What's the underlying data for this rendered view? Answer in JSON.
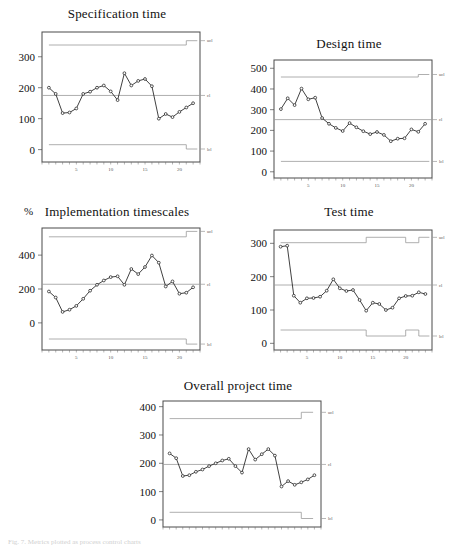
{
  "figure": {
    "caption_fragment": "Fig. 7. Metrics plotted as process control charts",
    "background": "#ffffff",
    "line_color": "#2b2b2b",
    "limit_color": "#9a9a9a",
    "frame_color": "#4a4a4a"
  },
  "limit_labels": {
    "ucl": "ucl",
    "cl": "cl",
    "lcl": "lcl"
  },
  "chart_data": [
    {
      "id": "specification-time",
      "type": "line",
      "title": "Specification time",
      "xlabel": "",
      "ylabel": "",
      "yunit": "",
      "xlim": [
        0,
        23
      ],
      "ylim": [
        -40,
        380
      ],
      "yticks": [
        0,
        100,
        200,
        300
      ],
      "xticks": [
        5,
        10,
        15,
        20
      ],
      "grid": false,
      "legend": "right-edge-labels",
      "x": [
        1,
        2,
        3,
        4,
        5,
        6,
        7,
        8,
        9,
        10,
        11,
        12,
        13,
        14,
        15,
        16,
        17,
        18,
        19,
        20,
        21,
        22
      ],
      "values": [
        200,
        180,
        118,
        120,
        133,
        180,
        187,
        200,
        207,
        188,
        160,
        247,
        207,
        222,
        228,
        205,
        100,
        115,
        105,
        122,
        136,
        150
      ],
      "control_limits": {
        "cl": 175,
        "ucl_segments": [
          {
            "from": 1,
            "to": 21,
            "value": 338
          },
          {
            "from": 21,
            "to": 22.6,
            "value": 352
          }
        ],
        "lcl_segments": [
          {
            "from": 1,
            "to": 21,
            "value": 16
          },
          {
            "from": 21,
            "to": 22.6,
            "value": 2
          }
        ]
      }
    },
    {
      "id": "design-time",
      "type": "line",
      "title": "Design time",
      "xlabel": "",
      "ylabel": "",
      "yunit": "",
      "xlim": [
        0,
        23
      ],
      "ylim": [
        -30,
        540
      ],
      "yticks": [
        0,
        100,
        200,
        300,
        400,
        500
      ],
      "xticks": [
        5,
        10,
        15,
        20
      ],
      "grid": false,
      "legend": "right-edge-labels",
      "x": [
        1,
        2,
        3,
        4,
        5,
        6,
        7,
        8,
        9,
        10,
        11,
        12,
        13,
        14,
        15,
        16,
        17,
        18,
        19,
        20,
        21,
        22
      ],
      "values": [
        303,
        355,
        322,
        402,
        350,
        358,
        260,
        232,
        212,
        197,
        235,
        215,
        196,
        182,
        192,
        178,
        148,
        160,
        162,
        205,
        193,
        232
      ],
      "control_limits": {
        "cl": 252,
        "ucl_segments": [
          {
            "from": 1,
            "to": 21,
            "value": 458
          },
          {
            "from": 21,
            "to": 22.6,
            "value": 470
          }
        ],
        "lcl_segments": [
          {
            "from": 1,
            "to": 22.6,
            "value": 50
          }
        ]
      }
    },
    {
      "id": "implementation-timescales",
      "type": "line",
      "title": "Implementation timescales",
      "xlabel": "",
      "ylabel": "",
      "yunit": "%",
      "xlim": [
        0,
        23
      ],
      "ylim": [
        -160,
        560
      ],
      "yticks": [
        0,
        200,
        400
      ],
      "xticks": [
        5,
        10,
        15,
        20
      ],
      "grid": false,
      "legend": "right-edge-labels",
      "x": [
        1,
        2,
        3,
        4,
        5,
        6,
        7,
        8,
        9,
        10,
        11,
        12,
        13,
        14,
        15,
        16,
        17,
        18,
        19,
        20,
        21,
        22
      ],
      "values": [
        185,
        150,
        65,
        78,
        100,
        142,
        190,
        225,
        250,
        270,
        275,
        225,
        318,
        288,
        330,
        398,
        355,
        215,
        245,
        172,
        178,
        210
      ],
      "control_limits": {
        "cl": 228,
        "ucl_segments": [
          {
            "from": 1,
            "to": 21,
            "value": 508
          },
          {
            "from": 21,
            "to": 22.6,
            "value": 540
          }
        ],
        "lcl_segments": [
          {
            "from": 1,
            "to": 21,
            "value": -95
          },
          {
            "from": 21,
            "to": 22.6,
            "value": -125
          }
        ]
      }
    },
    {
      "id": "test-time",
      "type": "line",
      "title": "Test time",
      "xlabel": "",
      "ylabel": "",
      "yunit": "",
      "xlim": [
        0,
        24
      ],
      "ylim": [
        -20,
        340
      ],
      "yticks": [
        0,
        100,
        200,
        300
      ],
      "xticks": [
        5,
        10,
        15,
        20
      ],
      "grid": false,
      "legend": "right-edge-labels",
      "x": [
        1,
        2,
        3,
        4,
        5,
        6,
        7,
        8,
        9,
        10,
        11,
        12,
        13,
        14,
        15,
        16,
        17,
        18,
        19,
        20,
        21,
        22,
        23
      ],
      "values": [
        290,
        293,
        143,
        122,
        135,
        136,
        140,
        158,
        192,
        165,
        157,
        160,
        130,
        98,
        122,
        118,
        100,
        107,
        135,
        142,
        143,
        153,
        148
      ],
      "control_limits": {
        "cl": 175,
        "ucl_segments": [
          {
            "from": 1,
            "to": 14,
            "value": 302
          },
          {
            "from": 14,
            "to": 20,
            "value": 318
          },
          {
            "from": 20,
            "to": 22,
            "value": 302
          },
          {
            "from": 22,
            "to": 23.6,
            "value": 318
          }
        ],
        "lcl_segments": [
          {
            "from": 1,
            "to": 14,
            "value": 40
          },
          {
            "from": 14,
            "to": 20,
            "value": 22
          },
          {
            "from": 20,
            "to": 22,
            "value": 40
          },
          {
            "from": 22,
            "to": 23.6,
            "value": 22
          }
        ]
      }
    },
    {
      "id": "overall-project-time",
      "type": "line",
      "title": "Overall project time",
      "xlabel": "",
      "ylabel": "",
      "yunit": "",
      "xlim": [
        0,
        24
      ],
      "ylim": [
        -25,
        420
      ],
      "yticks": [
        0,
        100,
        200,
        300,
        400
      ],
      "xticks": [],
      "grid": false,
      "legend": "right-edge-labels",
      "x": [
        1,
        2,
        3,
        4,
        5,
        6,
        7,
        8,
        9,
        10,
        11,
        12,
        13,
        14,
        15,
        16,
        17,
        18,
        19,
        20,
        21,
        22,
        23
      ],
      "values": [
        235,
        218,
        155,
        158,
        170,
        178,
        190,
        200,
        210,
        216,
        190,
        167,
        250,
        213,
        232,
        250,
        227,
        118,
        137,
        124,
        133,
        143,
        158
      ],
      "control_limits": {
        "cl": 196,
        "ucl_segments": [
          {
            "from": 1,
            "to": 21,
            "value": 358
          },
          {
            "from": 21,
            "to": 22.8,
            "value": 380
          }
        ],
        "lcl_segments": [
          {
            "from": 1,
            "to": 21,
            "value": 27
          },
          {
            "from": 21,
            "to": 22.8,
            "value": 5
          }
        ]
      }
    }
  ]
}
